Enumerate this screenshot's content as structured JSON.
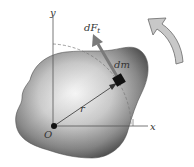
{
  "labels": {
    "y_axis": "y",
    "x_axis": "x",
    "origin": "O",
    "radius": "r",
    "mass_element": "dm",
    "force_main": "dF",
    "force_sub": "t"
  },
  "colors": {
    "body_dark": "#4a4a4a",
    "body_light": "#f4f4f4",
    "axis": "#555555",
    "rotation_arrow_fill": "#c8c8c8",
    "rotation_arrow_stroke": "#6a6a6a",
    "force_arrow": "#7a7a7a",
    "mass_block": "#111111"
  }
}
